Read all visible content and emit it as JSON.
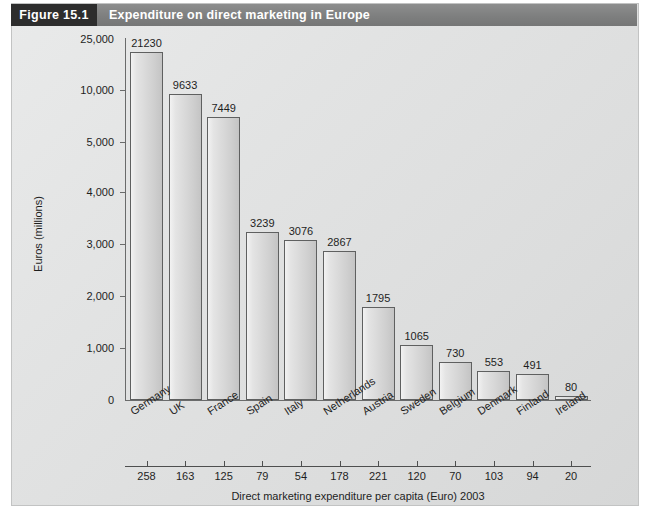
{
  "figure": {
    "number_label": "Figure 15.1",
    "title": "Expenditure on direct marketing in Europe"
  },
  "chart_data": {
    "type": "bar",
    "title": "Expenditure on direct marketing in Europe",
    "xlabel": "Direct marketing expenditure per capita (Euro) 2003",
    "ylabel": "Euros (millions)",
    "categories": [
      "Germany",
      "UK",
      "France",
      "Spain",
      "Italy",
      "Netherlands",
      "Austria",
      "Sweden",
      "Belgium",
      "Denmark",
      "Finland",
      "Ireland"
    ],
    "values": [
      21230,
      9633,
      7449,
      3239,
      3076,
      2867,
      1795,
      1065,
      730,
      553,
      491,
      80
    ],
    "value_labels": [
      "21230",
      "9633",
      "7449",
      "3239",
      "3076",
      "2867",
      "1795",
      "1065",
      "730",
      "553",
      "491",
      "80"
    ],
    "per_capita": [
      258,
      163,
      125,
      79,
      54,
      178,
      221,
      120,
      70,
      103,
      94,
      20
    ],
    "per_capita_labels": [
      "258",
      "163",
      "125",
      "79",
      "54",
      "178",
      "221",
      "120",
      "70",
      "103",
      "94",
      "20"
    ],
    "ytick_labels": [
      "25,000",
      "10,000",
      "5,000",
      "4,000",
      "3,000",
      "2,000",
      "1,000",
      "0"
    ],
    "ytick_values": [
      25000,
      10000,
      5000,
      4000,
      3000,
      2000,
      1000,
      0
    ],
    "axis_note": "broken / non-linear y-axis scale",
    "grid": false,
    "legend": "none",
    "ylim": [
      0,
      25000
    ]
  },
  "colors": {
    "header_number_bg": "#2d2d2d",
    "header_title_bg": "#7e7f7f",
    "panel_bg": "#e4e5e5",
    "bar_fill": "#d8d8d8",
    "bar_border": "#5f6060",
    "axis": "#6a6b6b",
    "text": "#1e1e1e"
  }
}
